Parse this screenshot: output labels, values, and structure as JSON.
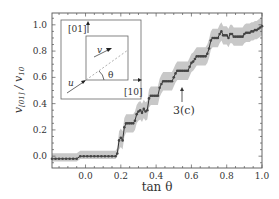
{
  "chart_data": {
    "type": "line",
    "title": "",
    "xlabel": "tan θ",
    "ylabel": "v[01] / v10",
    "xlim": [
      -0.19,
      1.0
    ],
    "ylim": [
      -0.09,
      1.09
    ],
    "x_ticks": [
      "0.0",
      "0.2",
      "0.4",
      "0.6",
      "0.8",
      "1.0"
    ],
    "y_ticks": [
      "0.0",
      "0.2",
      "0.4",
      "0.6",
      "0.8",
      "1.0"
    ],
    "grid": false,
    "legend": null,
    "annotations": [
      {
        "text": "3(c)",
        "x": 0.53,
        "y": 0.5,
        "arrow_to": [
          0.52,
          0.65
        ]
      }
    ],
    "inset": {
      "labels": {
        "axis_y": "[01]",
        "axis_x": "[10]",
        "vec_u": "u",
        "vec_v": "v",
        "angle": "θ"
      }
    },
    "series": [
      {
        "name": "mean",
        "color": "#333333",
        "marker": "circle",
        "x": [
          -0.19,
          -0.17,
          -0.15,
          -0.13,
          -0.11,
          -0.09,
          -0.07,
          -0.05,
          -0.03,
          -0.01,
          0.01,
          0.03,
          0.05,
          0.07,
          0.09,
          0.11,
          0.13,
          0.15,
          0.17,
          0.18,
          0.19,
          0.2,
          0.21,
          0.22,
          0.23,
          0.24,
          0.25,
          0.26,
          0.27,
          0.28,
          0.29,
          0.3,
          0.31,
          0.32,
          0.33,
          0.34,
          0.35,
          0.36,
          0.37,
          0.38,
          0.39,
          0.4,
          0.41,
          0.42,
          0.43,
          0.44,
          0.45,
          0.46,
          0.47,
          0.48,
          0.49,
          0.5,
          0.51,
          0.52,
          0.53,
          0.54,
          0.55,
          0.56,
          0.57,
          0.58,
          0.59,
          0.6,
          0.61,
          0.62,
          0.63,
          0.64,
          0.65,
          0.66,
          0.67,
          0.68,
          0.69,
          0.7,
          0.71,
          0.72,
          0.73,
          0.74,
          0.75,
          0.76,
          0.77,
          0.78,
          0.79,
          0.8,
          0.81,
          0.82,
          0.83,
          0.84,
          0.85,
          0.86,
          0.87,
          0.88,
          0.89,
          0.9,
          0.91,
          0.92,
          0.93,
          0.94,
          0.95,
          0.96,
          0.97,
          0.98,
          0.99,
          1.0
        ],
        "y": [
          -0.02,
          -0.02,
          -0.02,
          -0.02,
          -0.02,
          -0.02,
          -0.02,
          -0.02,
          0.0,
          0.0,
          0.0,
          0.0,
          0.0,
          0.0,
          0.0,
          0.0,
          0.0,
          0.0,
          0.0,
          0.02,
          0.12,
          0.14,
          0.12,
          0.22,
          0.25,
          0.25,
          0.25,
          0.25,
          0.25,
          0.27,
          0.32,
          0.34,
          0.35,
          0.33,
          0.36,
          0.34,
          0.35,
          0.44,
          0.46,
          0.46,
          0.46,
          0.46,
          0.46,
          0.52,
          0.55,
          0.57,
          0.57,
          0.57,
          0.57,
          0.57,
          0.57,
          0.6,
          0.63,
          0.65,
          0.65,
          0.65,
          0.65,
          0.65,
          0.65,
          0.65,
          0.68,
          0.71,
          0.72,
          0.74,
          0.76,
          0.76,
          0.76,
          0.76,
          0.76,
          0.76,
          0.78,
          0.82,
          0.88,
          0.9,
          0.9,
          0.9,
          0.9,
          0.93,
          0.95,
          0.92,
          0.92,
          0.92,
          0.9,
          0.93,
          0.93,
          0.91,
          0.91,
          0.91,
          0.91,
          0.91,
          0.91,
          0.93,
          0.94,
          0.94,
          0.94,
          0.95,
          0.95,
          0.96,
          0.96,
          0.97,
          0.98,
          0.99
        ]
      },
      {
        "name": "uncertainty_band",
        "color": "#c8c8c8",
        "type": "area",
        "half_width": 0.07
      }
    ]
  }
}
